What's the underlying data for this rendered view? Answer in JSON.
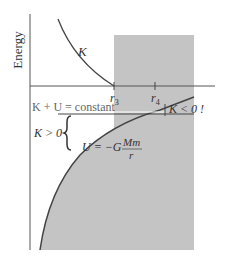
{
  "diagram": {
    "y_axis_label": "Energy",
    "curve_K_label": "K",
    "r3_label": "r",
    "r3_sub": "3",
    "r4_label": "r",
    "r4_sub": "4",
    "total_energy_label": "K + U = constant",
    "K_negative_label": "K < 0 !",
    "K_positive_label": "K > 0",
    "potential_label_lhs": "U = −G",
    "potential_num": "Mm",
    "potential_den": "r",
    "colors": {
      "shade": "#c4c4c4",
      "line": "#444444",
      "text": "#333333"
    }
  }
}
